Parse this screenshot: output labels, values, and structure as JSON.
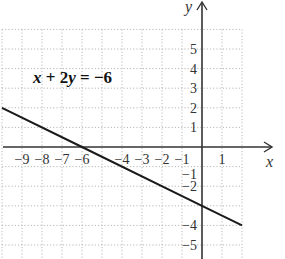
{
  "chart_data": {
    "type": "line",
    "title": "",
    "annotation": "x + 2y = −6",
    "equation": {
      "lhs_x": "x",
      "plus": " + 2",
      "lhs_y": "y",
      "rhs": " = −6"
    },
    "xlabel": "x",
    "ylabel": "y",
    "xlim": [
      -10,
      2
    ],
    "ylim": [
      -5.6,
      6
    ],
    "grid": true,
    "x_tick_labels": [
      {
        "value": -9,
        "label": "−9"
      },
      {
        "value": -8,
        "label": "−8"
      },
      {
        "value": -7,
        "label": "−7"
      },
      {
        "value": -6,
        "label": "−6"
      },
      {
        "value": -4,
        "label": "−4"
      },
      {
        "value": -3,
        "label": "−3"
      },
      {
        "value": -2,
        "label": "−2"
      },
      {
        "value": -1,
        "label": "−1"
      },
      {
        "value": 1,
        "label": "1"
      }
    ],
    "y_tick_labels": [
      {
        "value": 5,
        "label": "5"
      },
      {
        "value": 4,
        "label": "4"
      },
      {
        "value": 3,
        "label": "3"
      },
      {
        "value": 2,
        "label": "2"
      },
      {
        "value": 1,
        "label": "1"
      },
      {
        "value": -1,
        "label": "−1"
      },
      {
        "value": -2,
        "label": "−2"
      },
      {
        "value": -4,
        "label": "−4"
      },
      {
        "value": -5,
        "label": "−5"
      }
    ],
    "series": [
      {
        "name": "x + 2y = −6",
        "x": [
          -10,
          -6,
          0,
          2
        ],
        "y": [
          2,
          0,
          -3,
          -4
        ]
      }
    ],
    "colors": {
      "line": "#1a1a1a",
      "axis": "#333333",
      "grid": "#b8b8b8"
    }
  }
}
